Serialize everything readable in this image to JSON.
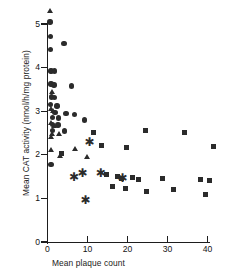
{
  "chart_data": {
    "type": "scatter",
    "title": "",
    "xlabel": "Mean plaque count",
    "ylabel": "Mean CAT activity  (nmol/h/mg protein)",
    "xlim": [
      0,
      43
    ],
    "ylim": [
      0,
      5.4
    ],
    "xticks": [
      0,
      10,
      20,
      30,
      40
    ],
    "xtick_labels": [
      "0",
      "10",
      "20",
      "30",
      "40"
    ],
    "yticks": [
      0,
      1,
      2,
      3,
      4,
      5
    ],
    "ytick_labels": [
      "0",
      "1",
      "2",
      "3",
      "4",
      "5"
    ],
    "grid": false,
    "legend": "none",
    "series": [
      {
        "name": "circles",
        "marker": "circle",
        "color": "#2b2b2b",
        "points": [
          [
            0.6,
            5.05
          ],
          [
            0.7,
            4.72
          ],
          [
            0.8,
            4.42
          ],
          [
            4.1,
            4.55
          ],
          [
            0.9,
            3.92
          ],
          [
            1.7,
            3.92
          ],
          [
            0.9,
            3.62
          ],
          [
            1.6,
            3.6
          ],
          [
            6.0,
            3.58
          ],
          [
            1.0,
            3.33
          ],
          [
            1.7,
            3.32
          ],
          [
            0.8,
            3.16
          ],
          [
            2.4,
            3.12
          ],
          [
            1.9,
            2.97
          ],
          [
            4.6,
            2.95
          ],
          [
            6.7,
            2.92
          ],
          [
            1.2,
            2.86
          ],
          [
            2.8,
            2.84
          ],
          [
            9.2,
            2.8
          ],
          [
            1.3,
            2.7
          ],
          [
            2.6,
            2.68
          ],
          [
            1.2,
            2.56
          ],
          [
            4.3,
            2.55
          ],
          [
            0.9,
            1.78
          ]
        ]
      },
      {
        "name": "triangles",
        "marker": "triangle",
        "color": "#2b2b2b",
        "points": [
          [
            0.7,
            5.3
          ],
          [
            1.1,
            3.44
          ],
          [
            0.8,
            3.04
          ],
          [
            1.5,
            3.0
          ],
          [
            0.9,
            2.72
          ],
          [
            1.7,
            2.66
          ],
          [
            1.1,
            2.48
          ],
          [
            3.0,
            2.48
          ],
          [
            0.9,
            2.4
          ],
          [
            1.0,
            2.1
          ],
          [
            6.9,
            2.13
          ],
          [
            3.1,
            1.96
          ],
          [
            9.8,
            1.94
          ]
        ]
      },
      {
        "name": "squares",
        "marker": "square",
        "color": "#2b2b2b",
        "points": [
          [
            11.4,
            2.52
          ],
          [
            24.6,
            2.56
          ],
          [
            34.2,
            2.52
          ],
          [
            3.5,
            2.04
          ],
          [
            13.6,
            2.22
          ],
          [
            19.8,
            2.17
          ],
          [
            41.4,
            2.18
          ],
          [
            14.8,
            1.55
          ],
          [
            17.4,
            1.5
          ],
          [
            18.6,
            1.45
          ],
          [
            21.3,
            1.48
          ],
          [
            22.8,
            1.44
          ],
          [
            28.7,
            1.46
          ],
          [
            38.2,
            1.44
          ],
          [
            40.6,
            1.4
          ],
          [
            16.2,
            1.28
          ],
          [
            19.5,
            1.22
          ],
          [
            24.8,
            1.16
          ],
          [
            31.6,
            1.2
          ],
          [
            39.4,
            1.08
          ]
        ]
      },
      {
        "name": "asterisks",
        "marker": "asterisk",
        "color": "#2b2b2b",
        "points": [
          [
            10.4,
            2.28
          ],
          [
            6.5,
            1.48
          ],
          [
            8.6,
            1.58
          ],
          [
            13.2,
            1.56
          ],
          [
            18.6,
            1.46
          ],
          [
            9.4,
            0.96
          ]
        ]
      }
    ]
  }
}
